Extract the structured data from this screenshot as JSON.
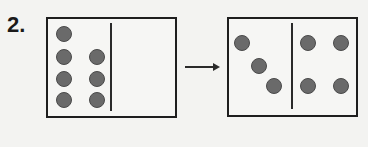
{
  "problem": {
    "number_label": "2.",
    "before": {
      "description": "Ten-frame style box with 7 counters on left of divider",
      "left_side_counters": 7,
      "right_side_counters": 0
    },
    "after": {
      "description": "Box with 3 counters left of divider, 4 counters right of divider",
      "left_side_counters": 3,
      "right_side_counters": 4
    },
    "arrow": "arrow-right-icon"
  },
  "colors": {
    "counter_fill": "#6a6a6a",
    "border": "#1e1e1e",
    "background": "#f3f3f1"
  }
}
